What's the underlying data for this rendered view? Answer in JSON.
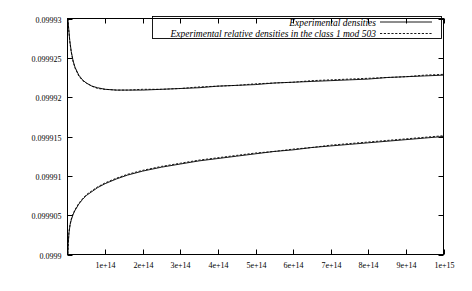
{
  "chart_data": {
    "type": "line",
    "title": "",
    "xlabel": "",
    "ylabel": "",
    "xlim": [
      0,
      1000000000000000.0
    ],
    "ylim": [
      0.0999,
      0.09993
    ],
    "grid": false,
    "legend_position": "top-right-inside",
    "xticks": [
      {
        "value": 100000000000000.0,
        "label": "1e+14"
      },
      {
        "value": 200000000000000.0,
        "label": "2e+14"
      },
      {
        "value": 300000000000000.0,
        "label": "3e+14"
      },
      {
        "value": 400000000000000.0,
        "label": "4e+14"
      },
      {
        "value": 500000000000000.0,
        "label": "5e+14"
      },
      {
        "value": 600000000000000.0,
        "label": "6e+14"
      },
      {
        "value": 700000000000000.0,
        "label": "7e+14"
      },
      {
        "value": 800000000000000.0,
        "label": "8e+14"
      },
      {
        "value": 900000000000000.0,
        "label": "9e+14"
      },
      {
        "value": 1000000000000000.0,
        "label": "1e+15"
      }
    ],
    "yticks": [
      {
        "value": 0.09993,
        "label": "0.09993"
      },
      {
        "value": 0.099925,
        "label": "0.099925"
      },
      {
        "value": 0.09992,
        "label": "0.09992"
      },
      {
        "value": 0.099915,
        "label": "0.099915"
      },
      {
        "value": 0.09991,
        "label": "0.09991"
      },
      {
        "value": 0.099905,
        "label": "0.099905"
      },
      {
        "value": 0.0999,
        "label": "0.0999"
      }
    ],
    "series": [
      {
        "name": "Experimental densities",
        "style": "solid",
        "color": "#000000",
        "points": [
          [
            1000000000000.0,
            0.09993
          ],
          [
            3000000000000.0,
            0.0999288
          ],
          [
            6000000000000.0,
            0.0999272
          ],
          [
            10000000000000.0,
            0.0999258
          ],
          [
            15000000000000.0,
            0.0999246
          ],
          [
            20000000000000.0,
            0.0999238
          ],
          [
            30000000000000.0,
            0.0999228
          ],
          [
            40000000000000.0,
            0.0999222
          ],
          [
            50000000000000.0,
            0.0999218
          ],
          [
            65000000000000.0,
            0.0999214
          ],
          [
            80000000000000.0,
            0.0999212
          ],
          [
            100000000000000.0,
            0.099921
          ],
          [
            130000000000000.0,
            0.0999209
          ],
          [
            160000000000000.0,
            0.0999209
          ],
          [
            200000000000000.0,
            0.0999209
          ],
          [
            250000000000000.0,
            0.099921
          ],
          [
            300000000000000.0,
            0.0999211
          ],
          [
            350000000000000.0,
            0.0999212
          ],
          [
            400000000000000.0,
            0.0999214
          ],
          [
            450000000000000.0,
            0.0999215
          ],
          [
            500000000000000.0,
            0.0999216
          ],
          [
            550000000000000.0,
            0.0999218
          ],
          [
            600000000000000.0,
            0.0999219
          ],
          [
            650000000000000.0,
            0.099922
          ],
          [
            700000000000000.0,
            0.0999221
          ],
          [
            750000000000000.0,
            0.0999222
          ],
          [
            800000000000000.0,
            0.0999223
          ],
          [
            850000000000000.0,
            0.0999225
          ],
          [
            900000000000000.0,
            0.0999226
          ],
          [
            950000000000000.0,
            0.0999227
          ],
          [
            1000000000000000.0,
            0.0999228
          ]
        ]
      },
      {
        "name": "Experimental relative densities in the class 1 mod 503",
        "style": "dashed",
        "color": "#000000",
        "points": [
          [
            1000000000000.0,
            0.09993
          ],
          [
            3000000000000.0,
            0.0999287
          ],
          [
            6000000000000.0,
            0.0999271
          ],
          [
            10000000000000.0,
            0.0999257
          ],
          [
            15000000000000.0,
            0.0999245
          ],
          [
            20000000000000.0,
            0.0999237
          ],
          [
            30000000000000.0,
            0.0999227
          ],
          [
            40000000000000.0,
            0.0999221
          ],
          [
            50000000000000.0,
            0.0999218
          ],
          [
            65000000000000.0,
            0.0999214
          ],
          [
            80000000000000.0,
            0.0999211
          ],
          [
            100000000000000.0,
            0.099921
          ],
          [
            130000000000000.0,
            0.0999209
          ],
          [
            160000000000000.0,
            0.0999209
          ],
          [
            200000000000000.0,
            0.099921
          ],
          [
            250000000000000.0,
            0.099921
          ],
          [
            300000000000000.0,
            0.0999211
          ],
          [
            350000000000000.0,
            0.0999213
          ],
          [
            400000000000000.0,
            0.0999214
          ],
          [
            450000000000000.0,
            0.0999215
          ],
          [
            500000000000000.0,
            0.0999217
          ],
          [
            550000000000000.0,
            0.0999218
          ],
          [
            600000000000000.0,
            0.0999219
          ],
          [
            650000000000000.0,
            0.0999221
          ],
          [
            700000000000000.0,
            0.0999222
          ],
          [
            750000000000000.0,
            0.0999223
          ],
          [
            800000000000000.0,
            0.0999224
          ],
          [
            850000000000000.0,
            0.0999225
          ],
          [
            900000000000000.0,
            0.0999226
          ],
          [
            950000000000000.0,
            0.0999228
          ],
          [
            1000000000000000.0,
            0.0999229
          ]
        ]
      },
      {
        "name": "Experimental densities (lower branch)",
        "style": "solid",
        "color": "#000000",
        "points": [
          [
            1000000000000.0,
            0.0999
          ],
          [
            2000000000000.0,
            0.0999014
          ],
          [
            4000000000000.0,
            0.0999028
          ],
          [
            7000000000000.0,
            0.0999038
          ],
          [
            10000000000000.0,
            0.0999044
          ],
          [
            15000000000000.0,
            0.0999051
          ],
          [
            20000000000000.0,
            0.0999056
          ],
          [
            30000000000000.0,
            0.0999064
          ],
          [
            40000000000000.0,
            0.099907
          ],
          [
            50000000000000.0,
            0.0999075
          ],
          [
            65000000000000.0,
            0.099908
          ],
          [
            80000000000000.0,
            0.0999085
          ],
          [
            100000000000000.0,
            0.099909
          ],
          [
            130000000000000.0,
            0.0999096
          ],
          [
            160000000000000.0,
            0.0999101
          ],
          [
            200000000000000.0,
            0.0999106
          ],
          [
            250000000000000.0,
            0.0999111
          ],
          [
            300000000000000.0,
            0.0999115
          ],
          [
            350000000000000.0,
            0.0999119
          ],
          [
            400000000000000.0,
            0.0999122
          ],
          [
            450000000000000.0,
            0.0999125
          ],
          [
            500000000000000.0,
            0.0999128
          ],
          [
            550000000000000.0,
            0.0999131
          ],
          [
            600000000000000.0,
            0.0999133
          ],
          [
            650000000000000.0,
            0.0999136
          ],
          [
            700000000000000.0,
            0.0999138
          ],
          [
            750000000000000.0,
            0.099914
          ],
          [
            800000000000000.0,
            0.0999142
          ],
          [
            850000000000000.0,
            0.0999144
          ],
          [
            900000000000000.0,
            0.0999146
          ],
          [
            950000000000000.0,
            0.0999148
          ],
          [
            1000000000000000.0,
            0.099915
          ]
        ]
      },
      {
        "name": "Experimental relative densities in the class 1 mod 503 (lower branch)",
        "style": "dashed",
        "color": "#000000",
        "points": [
          [
            1000000000000.0,
            0.0999001
          ],
          [
            2000000000000.0,
            0.0999015
          ],
          [
            4000000000000.0,
            0.0999029
          ],
          [
            7000000000000.0,
            0.0999039
          ],
          [
            10000000000000.0,
            0.0999045
          ],
          [
            15000000000000.0,
            0.0999052
          ],
          [
            20000000000000.0,
            0.0999057
          ],
          [
            30000000000000.0,
            0.0999065
          ],
          [
            40000000000000.0,
            0.0999071
          ],
          [
            50000000000000.0,
            0.0999076
          ],
          [
            65000000000000.0,
            0.0999081
          ],
          [
            80000000000000.0,
            0.0999086
          ],
          [
            100000000000000.0,
            0.0999091
          ],
          [
            130000000000000.0,
            0.0999097
          ],
          [
            160000000000000.0,
            0.0999102
          ],
          [
            200000000000000.0,
            0.0999107
          ],
          [
            250000000000000.0,
            0.0999112
          ],
          [
            300000000000000.0,
            0.0999116
          ],
          [
            350000000000000.0,
            0.099912
          ],
          [
            400000000000000.0,
            0.0999123
          ],
          [
            450000000000000.0,
            0.0999126
          ],
          [
            500000000000000.0,
            0.0999129
          ],
          [
            550000000000000.0,
            0.0999131
          ],
          [
            600000000000000.0,
            0.0999134
          ],
          [
            650000000000000.0,
            0.0999136
          ],
          [
            700000000000000.0,
            0.0999139
          ],
          [
            750000000000000.0,
            0.0999141
          ],
          [
            800000000000000.0,
            0.0999143
          ],
          [
            850000000000000.0,
            0.0999145
          ],
          [
            900000000000000.0,
            0.0999147
          ],
          [
            950000000000000.0,
            0.0999149
          ],
          [
            1000000000000000.0,
            0.0999151
          ]
        ]
      }
    ],
    "legend": [
      {
        "label": "Experimental densities",
        "style": "solid"
      },
      {
        "label": "Experimental relative densities in the class 1 mod 503",
        "style": "dashed"
      }
    ]
  }
}
